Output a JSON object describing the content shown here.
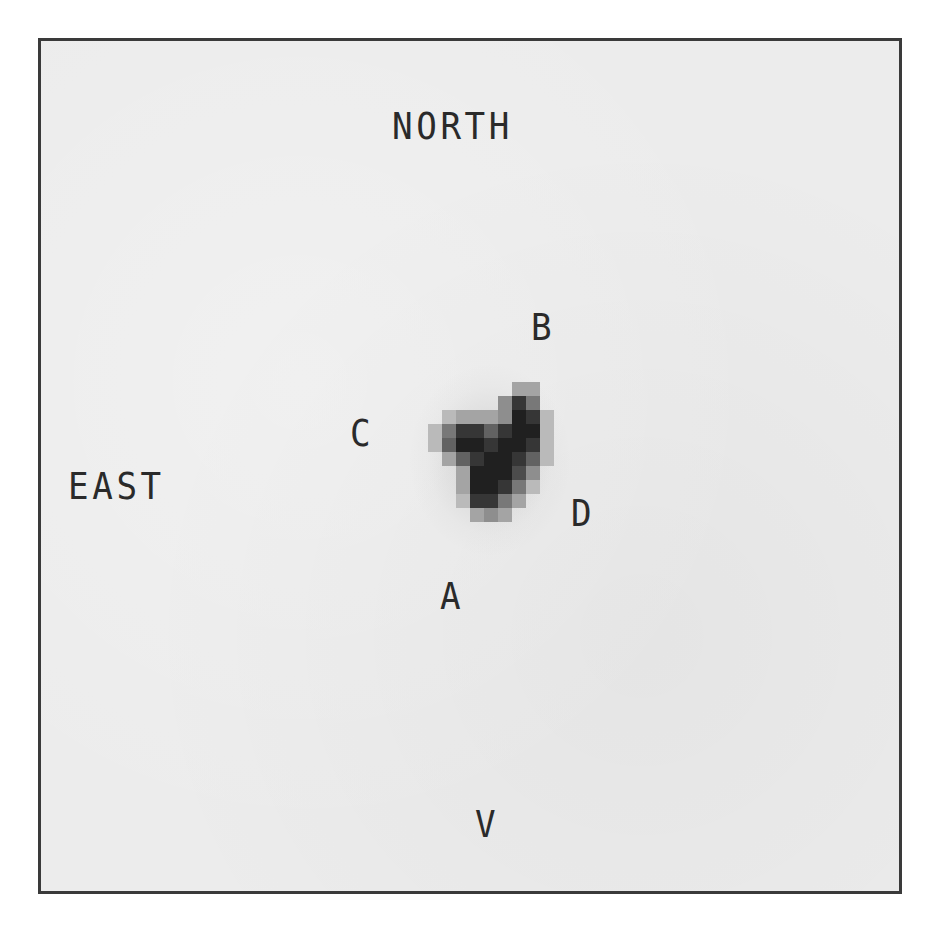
{
  "image": {
    "description": "Grayscale pixelated astronomical image of a quadruply lensed object (four components A, B, C, D) inside a square frame with compass labels",
    "frame_color": "#3a3a3a",
    "background_color": "#ececec"
  },
  "labels": {
    "north": "NORTH",
    "east": "EAST",
    "band": "V",
    "component_a": "A",
    "component_b": "B",
    "component_c": "C",
    "component_d": "D"
  },
  "blob": {
    "origin_x": 428,
    "origin_y": 382,
    "cell_size": 14,
    "grid": [
      [
        0,
        0,
        0,
        0,
        0,
        0,
        3,
        3,
        0
      ],
      [
        0,
        0,
        0,
        0,
        0,
        4,
        8,
        5,
        0
      ],
      [
        0,
        2,
        3,
        3,
        3,
        4,
        9,
        8,
        2
      ],
      [
        2,
        5,
        8,
        8,
        6,
        8,
        9,
        9,
        2
      ],
      [
        2,
        6,
        9,
        9,
        8,
        9,
        9,
        8,
        2
      ],
      [
        0,
        3,
        6,
        8,
        9,
        9,
        8,
        6,
        2
      ],
      [
        0,
        0,
        3,
        9,
        9,
        9,
        7,
        4,
        0
      ],
      [
        0,
        0,
        3,
        9,
        9,
        8,
        5,
        2,
        0
      ],
      [
        0,
        0,
        2,
        8,
        8,
        5,
        3,
        0,
        0
      ],
      [
        0,
        0,
        0,
        3,
        4,
        3,
        0,
        0,
        0
      ]
    ]
  }
}
